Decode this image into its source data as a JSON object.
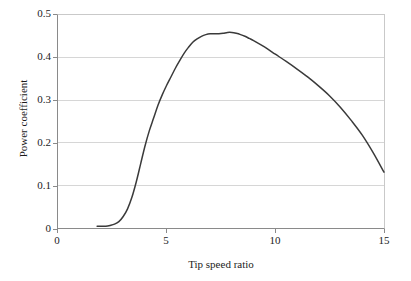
{
  "chart_data": {
    "type": "line",
    "title": "",
    "xlabel": "Tip speed ratio",
    "ylabel": "Power coefficient",
    "xlim": [
      0,
      15
    ],
    "ylim": [
      0,
      0.5
    ],
    "xticks": [
      "0",
      "5",
      "10",
      "15"
    ],
    "xtick_values": [
      0,
      5,
      10,
      15
    ],
    "yticks": [
      "0",
      "0.1",
      "0.2",
      "0.3",
      "0.4",
      "0.5"
    ],
    "ytick_values": [
      0,
      0.1,
      0.2,
      0.3,
      0.4,
      0.5
    ],
    "grid": "horizontal",
    "legend": "none",
    "series": [
      {
        "name": "Power coefficient",
        "color": "#3a3a3a",
        "x": [
          0.0,
          1.8,
          2.0,
          2.2,
          2.4,
          2.6,
          2.8,
          3.0,
          3.2,
          3.4,
          3.6,
          3.8,
          4.0,
          4.2,
          4.4,
          4.6,
          4.8,
          5.0,
          5.2,
          5.4,
          5.6,
          5.8,
          6.0,
          6.2,
          6.4,
          6.6,
          6.8,
          7.0,
          7.2,
          7.4,
          7.6,
          7.8,
          8.0,
          8.2,
          8.4,
          8.6,
          8.8,
          9.0,
          9.5,
          10.0,
          10.5,
          11.0,
          11.5,
          12.0,
          12.5,
          13.0,
          13.5,
          14.0,
          14.5,
          15.0
        ],
        "y": [
          null,
          0.004,
          0.004,
          0.004,
          0.006,
          0.009,
          0.015,
          0.027,
          0.045,
          0.072,
          0.108,
          0.15,
          0.192,
          0.228,
          0.258,
          0.288,
          0.313,
          0.335,
          0.355,
          0.375,
          0.393,
          0.41,
          0.424,
          0.436,
          0.444,
          0.45,
          0.454,
          0.456,
          0.456,
          0.456,
          0.457,
          0.459,
          0.459,
          0.457,
          0.454,
          0.45,
          0.445,
          0.44,
          0.425,
          0.408,
          0.391,
          0.373,
          0.354,
          0.333,
          0.31,
          0.283,
          0.252,
          0.218,
          0.177,
          0.131
        ]
      }
    ]
  },
  "axes": {
    "x_title": "Tip speed ratio",
    "y_title": "Power coefficient",
    "x_tick_labels": [
      "0",
      "5",
      "10",
      "15"
    ],
    "y_tick_labels": [
      "0",
      "0.1",
      "0.2",
      "0.3",
      "0.4",
      "0.5"
    ]
  },
  "colors": {
    "curve": "#3a3a3a",
    "gridline": "#d6d6d6",
    "axis": "#8a8a8a",
    "background": "#ffffff",
    "text": "#1c1c1c"
  }
}
